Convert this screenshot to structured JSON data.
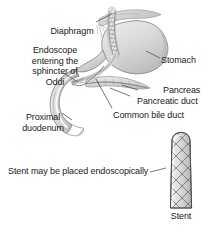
{
  "figure": {
    "background_color": "#ffffff",
    "text_color": "#222222",
    "line_color": "#555555"
  },
  "labels": {
    "diaphragm": "Diaphragm",
    "endoscope": "Endoscope\nentering the\nsphincter of\nOddi",
    "stomach": "Stomach",
    "pancreas": "Pancreas",
    "pancreatic_duct": "Pancreatic duct",
    "common_bile_duct": "Common bile duct",
    "proximal_duodenum": "Proximal\nduodenum",
    "stent_note": "Stent may be placed endoscopically",
    "stent": "Stent"
  },
  "anatomy_parts": [
    "diaphragm",
    "stomach",
    "esophagus",
    "endoscope",
    "pancreas",
    "pancreatic-duct",
    "common-bile-duct",
    "proximal-duodenum"
  ],
  "device": {
    "name": "Stent",
    "form": "braided mesh tube",
    "shading": "#9a9a9a"
  }
}
